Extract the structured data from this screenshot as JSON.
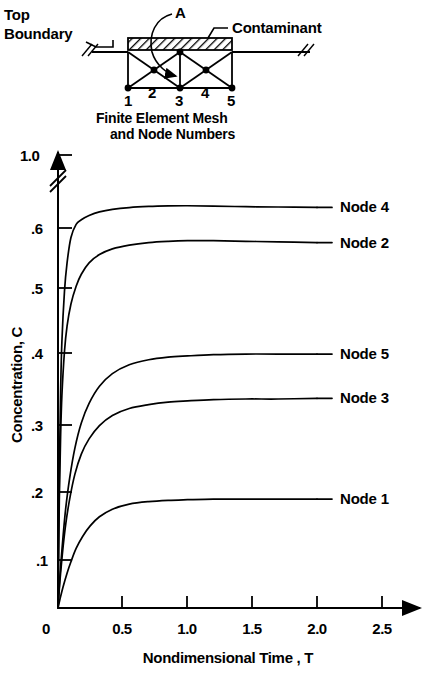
{
  "figure": {
    "inset": {
      "top_boundary_label": "Top\nBoundary",
      "top_boundary_line1": "Top",
      "top_boundary_line2": "Boundary",
      "contaminant_label": "Contaminant",
      "element_label": "A",
      "node_numbers": [
        "1",
        "2",
        "3",
        "4",
        "5"
      ],
      "caption_line1": "Finite Element Mesh",
      "caption_line2": "and Node Numbers"
    }
  },
  "chart_data": {
    "type": "line",
    "title": "",
    "xlabel": "Nondimensional Time , T",
    "ylabel": "Concentration, C",
    "xlim": [
      0,
      2.75
    ],
    "ylim": [
      0,
      1.0
    ],
    "grid": false,
    "legend_position": "right-inline-labels",
    "xticks": [
      0,
      0.5,
      1.0,
      1.5,
      2.0,
      2.5
    ],
    "xticklabels": [
      "0",
      "0.5",
      "1.0",
      "1.5",
      "2.0",
      "2.5"
    ],
    "yticks": [
      0.1,
      0.2,
      0.3,
      0.4,
      0.5,
      0.6,
      1.0
    ],
    "yticklabels": [
      ".1",
      ".2",
      ".3",
      ".4",
      ".5",
      ".6",
      "1.0"
    ],
    "y_axis_break": {
      "between": [
        0.6,
        1.0
      ],
      "symbol": "double-slash"
    },
    "series": [
      {
        "name": "Node 4",
        "label": "Node 4",
        "plateau": 0.72,
        "x": [
          0.0,
          0.01,
          0.02,
          0.03,
          0.05,
          0.07,
          0.1,
          0.14,
          0.18,
          0.24,
          0.32,
          0.42,
          0.55,
          0.7,
          0.85,
          1.0,
          1.2,
          1.45,
          1.7,
          2.0
        ],
        "y": [
          0.0,
          0.21,
          0.34,
          0.42,
          0.5,
          0.545,
          0.585,
          0.62,
          0.645,
          0.668,
          0.688,
          0.702,
          0.712,
          0.718,
          0.721,
          0.722,
          0.72,
          0.717,
          0.715,
          0.713
        ]
      },
      {
        "name": "Node 2",
        "label": "Node 2",
        "plateau": 0.58,
        "x": [
          0.0,
          0.01,
          0.02,
          0.03,
          0.05,
          0.07,
          0.1,
          0.14,
          0.18,
          0.24,
          0.32,
          0.42,
          0.55,
          0.7,
          0.85,
          1.0,
          1.2,
          1.45,
          1.7,
          2.0
        ],
        "y": [
          0.0,
          0.17,
          0.27,
          0.335,
          0.405,
          0.445,
          0.48,
          0.508,
          0.527,
          0.545,
          0.558,
          0.567,
          0.573,
          0.577,
          0.579,
          0.58,
          0.58,
          0.579,
          0.578,
          0.577
        ]
      },
      {
        "name": "Node 5",
        "label": "Node 5",
        "plateau": 0.4,
        "x": [
          0.0,
          0.01,
          0.02,
          0.04,
          0.06,
          0.09,
          0.13,
          0.18,
          0.24,
          0.32,
          0.42,
          0.55,
          0.7,
          0.85,
          1.0,
          1.2,
          1.45,
          1.7,
          2.0
        ],
        "y": [
          0.0,
          0.035,
          0.065,
          0.115,
          0.158,
          0.205,
          0.252,
          0.292,
          0.323,
          0.35,
          0.37,
          0.384,
          0.392,
          0.396,
          0.398,
          0.4,
          0.401,
          0.401,
          0.401
        ]
      },
      {
        "name": "Node 3",
        "label": "Node 3",
        "plateau": 0.33,
        "x": [
          0.0,
          0.01,
          0.02,
          0.04,
          0.06,
          0.09,
          0.13,
          0.18,
          0.24,
          0.32,
          0.42,
          0.55,
          0.7,
          0.85,
          1.0,
          1.2,
          1.45,
          1.7,
          2.0
        ],
        "y": [
          0.0,
          0.03,
          0.055,
          0.098,
          0.133,
          0.172,
          0.211,
          0.243,
          0.267,
          0.288,
          0.304,
          0.315,
          0.321,
          0.325,
          0.327,
          0.329,
          0.33,
          0.33,
          0.331
        ]
      },
      {
        "name": "Node 1",
        "label": "Node 1",
        "plateau": 0.17,
        "x": [
          0.0,
          0.02,
          0.04,
          0.07,
          0.1,
          0.14,
          0.19,
          0.25,
          0.32,
          0.42,
          0.55,
          0.7,
          0.85,
          1.0,
          1.2,
          1.45,
          1.7,
          2.0
        ],
        "y": [
          0.0,
          0.018,
          0.034,
          0.055,
          0.073,
          0.094,
          0.113,
          0.13,
          0.144,
          0.156,
          0.164,
          0.168,
          0.17,
          0.171,
          0.172,
          0.172,
          0.172,
          0.172
        ]
      }
    ]
  }
}
